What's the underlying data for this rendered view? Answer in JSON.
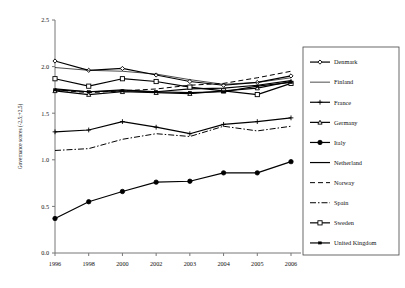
{
  "chart_data": {
    "type": "line",
    "title": "",
    "xlabel": "",
    "ylabel": "Governance scores (-2,5;+2,5)",
    "x": [
      "1996",
      "1998",
      "2000",
      "2002",
      "2003",
      "2004",
      "2005",
      "2006"
    ],
    "xlim": [
      0,
      7
    ],
    "ylim": [
      0.0,
      2.5
    ],
    "yticks": [
      "0.0",
      "0.5",
      "1.0",
      "1.5",
      "2.0",
      "2.5"
    ],
    "ytick_values": [
      0.0,
      0.5,
      1.0,
      1.5,
      2.0,
      2.5
    ],
    "grid": false,
    "legend_position": "right",
    "series": [
      {
        "name": "Denmark",
        "marker": "diamond",
        "style": "solid",
        "values": [
          2.06,
          1.96,
          1.98,
          1.91,
          1.84,
          1.8,
          1.83,
          1.9
        ]
      },
      {
        "name": "Finland",
        "marker": "none",
        "style": "thin",
        "values": [
          1.99,
          1.96,
          1.95,
          1.92,
          1.86,
          1.81,
          1.83,
          1.88
        ]
      },
      {
        "name": "France",
        "marker": "plus",
        "style": "solid",
        "values": [
          1.3,
          1.32,
          1.41,
          1.35,
          1.28,
          1.38,
          1.41,
          1.45
        ]
      },
      {
        "name": "Germany",
        "marker": "triangle",
        "style": "solid",
        "values": [
          1.74,
          1.7,
          1.73,
          1.72,
          1.71,
          1.74,
          1.77,
          1.84
        ]
      },
      {
        "name": "Italy",
        "marker": "circle",
        "style": "solid",
        "values": [
          0.37,
          0.55,
          0.66,
          0.76,
          0.77,
          0.86,
          0.86,
          0.98
        ]
      },
      {
        "name": "Netherland",
        "marker": "none",
        "style": "solid",
        "values": [
          1.76,
          1.73,
          1.75,
          1.73,
          1.76,
          1.77,
          1.8,
          1.85
        ]
      },
      {
        "name": "Norway",
        "marker": "none",
        "style": "dashed",
        "values": [
          1.75,
          1.72,
          1.74,
          1.76,
          1.8,
          1.82,
          1.88,
          1.95
        ]
      },
      {
        "name": "Spain",
        "marker": "none",
        "style": "dashdot",
        "values": [
          1.1,
          1.12,
          1.22,
          1.28,
          1.25,
          1.36,
          1.31,
          1.36
        ]
      },
      {
        "name": "Sweden",
        "marker": "square",
        "style": "solid",
        "values": [
          1.87,
          1.79,
          1.87,
          1.84,
          1.78,
          1.74,
          1.7,
          1.82
        ]
      },
      {
        "name": "United Kingdom",
        "marker": "dash-sq",
        "style": "solid",
        "values": [
          1.75,
          1.73,
          1.74,
          1.73,
          1.72,
          1.73,
          1.79,
          1.83
        ]
      }
    ]
  }
}
